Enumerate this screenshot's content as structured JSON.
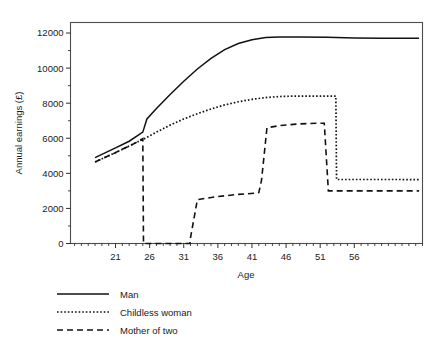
{
  "chart_data": {
    "type": "line",
    "title": "",
    "xlabel": "Age",
    "ylabel": "Annual earnings (£)",
    "xlim": [
      14.4,
      66.0
    ],
    "ylim": [
      0,
      12600
    ],
    "grid": false,
    "legend_position": "below-left",
    "x_ticks": [
      21,
      26,
      31,
      36,
      41,
      46,
      51,
      56
    ],
    "x_minor_tick_step": 1,
    "y_ticks": [
      0,
      2000,
      4000,
      6000,
      8000,
      10000,
      12000
    ],
    "y_minor_tick_step": 1000,
    "y_tick_labels": [
      "0",
      "2000",
      "4000",
      "6000",
      "8000",
      "10000",
      "12000"
    ],
    "x_tick_labels": [
      "21",
      "26",
      "31",
      "36",
      "41",
      "46",
      "51",
      "56"
    ],
    "series": [
      {
        "name": "Man",
        "style": "solid",
        "color": "#111111",
        "points": [
          [
            18.0,
            4900
          ],
          [
            21.0,
            5450
          ],
          [
            23.0,
            5830
          ],
          [
            25.0,
            6350
          ],
          [
            25.6,
            7100
          ],
          [
            27.0,
            7700
          ],
          [
            29.0,
            8500
          ],
          [
            31.0,
            9250
          ],
          [
            33.0,
            9950
          ],
          [
            35.0,
            10550
          ],
          [
            37.0,
            11050
          ],
          [
            39.0,
            11400
          ],
          [
            41.0,
            11620
          ],
          [
            43.0,
            11740
          ],
          [
            45.0,
            11780
          ],
          [
            48.0,
            11780
          ],
          [
            52.0,
            11760
          ],
          [
            56.0,
            11720
          ],
          [
            60.0,
            11700
          ],
          [
            65.5,
            11700
          ]
        ]
      },
      {
        "name": "Childless woman",
        "style": "dotted",
        "color": "#111111",
        "points": [
          [
            18.0,
            4650
          ],
          [
            21.0,
            5180
          ],
          [
            24.0,
            5750
          ],
          [
            25.5,
            6030
          ],
          [
            27.0,
            6350
          ],
          [
            29.0,
            6750
          ],
          [
            31.0,
            7100
          ],
          [
            33.0,
            7400
          ],
          [
            35.0,
            7670
          ],
          [
            37.0,
            7900
          ],
          [
            39.0,
            8080
          ],
          [
            41.0,
            8220
          ],
          [
            43.0,
            8320
          ],
          [
            45.0,
            8380
          ],
          [
            47.0,
            8400
          ],
          [
            50.0,
            8400
          ],
          [
            53.3,
            8400
          ],
          [
            53.4,
            3650
          ],
          [
            57.0,
            3650
          ],
          [
            62.0,
            3650
          ],
          [
            65.5,
            3640
          ]
        ]
      },
      {
        "name": "Mother of two",
        "style": "dashed",
        "color": "#111111",
        "points": [
          [
            18.0,
            4650
          ],
          [
            21.0,
            5180
          ],
          [
            24.0,
            5750
          ],
          [
            25.0,
            5980
          ],
          [
            25.1,
            0
          ],
          [
            31.9,
            0
          ],
          [
            32.0,
            350
          ],
          [
            33.0,
            2500
          ],
          [
            36.0,
            2680
          ],
          [
            39.0,
            2800
          ],
          [
            41.5,
            2870
          ],
          [
            42.0,
            2900
          ],
          [
            42.4,
            3600
          ],
          [
            43.2,
            6600
          ],
          [
            45.0,
            6720
          ],
          [
            48.0,
            6820
          ],
          [
            51.0,
            6860
          ],
          [
            51.6,
            6860
          ],
          [
            52.2,
            3000
          ],
          [
            56.0,
            3000
          ],
          [
            61.0,
            3000
          ],
          [
            65.5,
            3000
          ]
        ]
      }
    ],
    "legend": [
      {
        "label": "Man",
        "style": "solid"
      },
      {
        "label": "Childless woman",
        "style": "dotted"
      },
      {
        "label": "Mother of two",
        "style": "dashed"
      }
    ]
  }
}
